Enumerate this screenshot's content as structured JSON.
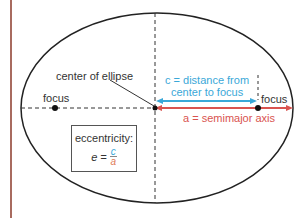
{
  "diagram": {
    "labels": {
      "center": "center of ellipse",
      "focus_left": "focus",
      "focus_right": "focus",
      "c_line1": "c = distance from",
      "c_line2": "center to focus",
      "a_label": "a = semimajor axis"
    },
    "eccentricity": {
      "title": "eccentricity:",
      "lhs": "e =",
      "numerator": "c",
      "denominator": "a"
    },
    "colors": {
      "ellipse": "#222222",
      "c_arrow": "#3aa8d8",
      "a_arrow": "#d9534f",
      "border_line": "#8b3a2a",
      "dashed": "#333333"
    }
  }
}
